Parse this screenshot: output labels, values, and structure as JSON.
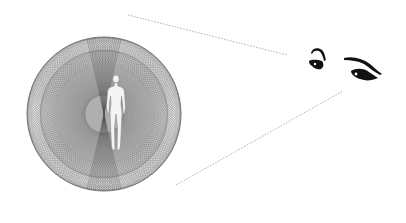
{
  "diagram": {
    "colors": {
      "background": "#ffffff",
      "mesh": "#6e6e6e",
      "inner_fill": "#b8b8b8",
      "figure": "#f4f4f4",
      "figure_outline": "#8a8a8a",
      "sightline": "#9a9a9a",
      "eyes": "#111111"
    },
    "sphere": {
      "cx": 104,
      "cy": 114,
      "outer_r": 77,
      "middle_r": 64,
      "inner_r": 48
    },
    "sightlines": [
      {
        "x1": 128,
        "y1": 15,
        "x2": 287,
        "y2": 55
      },
      {
        "x1": 176,
        "y1": 185,
        "x2": 343,
        "y2": 91
      }
    ],
    "nodes": [
      {
        "id": "energy-sphere",
        "label": ""
      },
      {
        "id": "human-figure",
        "label": ""
      },
      {
        "id": "eyes",
        "label": ""
      }
    ]
  }
}
